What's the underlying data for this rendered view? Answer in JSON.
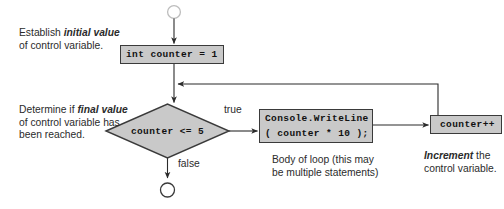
{
  "diagram": {
    "type": "flowchart",
    "colors": {
      "node_fill": "#c9c9c9",
      "node_stroke": "#3a3a3a",
      "line": "#2b2b2b",
      "terminal_start_stroke": "#bdbdbd",
      "terminal_end_stroke": "#3a3a3a",
      "background": "#ffffff",
      "text": "#2b2b2b"
    }
  },
  "nodes": {
    "start_terminal": {
      "shape": "circle",
      "label": ""
    },
    "init": {
      "shape": "process",
      "code": "int counter = 1"
    },
    "condition": {
      "shape": "decision",
      "code": "counter <= 5"
    },
    "body": {
      "shape": "process",
      "code_line_1": "Console.WriteLine",
      "code_line_2": "( counter * 10 );"
    },
    "increment": {
      "shape": "process",
      "code": "counter++"
    },
    "end_terminal": {
      "shape": "circle",
      "label": ""
    }
  },
  "edges": {
    "true_label": "true",
    "false_label": "false"
  },
  "captions": {
    "init": {
      "lead": "Establish ",
      "emphasis": "initial value",
      "tail": " of control variable."
    },
    "condition": {
      "lead": "Determine if ",
      "emphasis": "final value",
      "tail": " of control variable has been reached."
    },
    "body": {
      "lead": "",
      "emphasis": "",
      "tail": "Body of loop (this may be multiple statements)"
    },
    "increment": {
      "lead": "",
      "emphasis": "Increment",
      "tail": " the control variable."
    }
  }
}
